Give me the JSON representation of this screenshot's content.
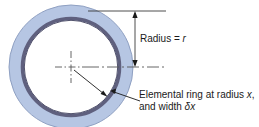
{
  "figure": {
    "labels": {
      "radius": {
        "prefix": "Radius = ",
        "symbol": "r"
      },
      "element": {
        "line1_prefix": "Elemental ring at radius ",
        "line2_symbol_x": "x",
        "line2_mid": ", and width ",
        "line2_delta": "δx"
      }
    },
    "colors": {
      "outer_ring_fill": "#b6c6e3",
      "inner_ring_fill": "#5f607e",
      "inner_ring_stroke": "#41415c",
      "outer_ring_stroke": "#8a9bbd",
      "center_fill": "#ffffff",
      "line_color": "#3a3a3a",
      "centerline_color": "#555555",
      "text_color": "#1a1a1a"
    },
    "geometry": {
      "center_x": 71,
      "center_y": 67,
      "outer_radius": 62,
      "ring_outer_radius": 50,
      "ring_inner_radius": 47,
      "dimension_line_x": 135,
      "dimension_top_y": 11,
      "dimension_bottom_y": 67
    }
  }
}
